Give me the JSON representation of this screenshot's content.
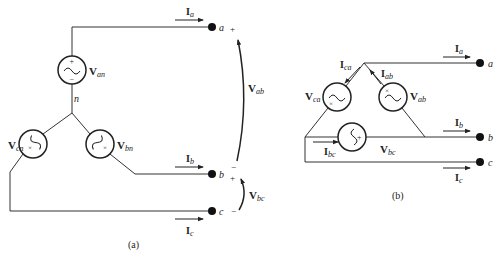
{
  "figure_a": {
    "caption": "(a)",
    "node_n": "n",
    "terminals": {
      "a": "a",
      "b": "b",
      "c": "c"
    },
    "sources": {
      "an": {
        "V": "V",
        "sub": "an"
      },
      "bn": {
        "V": "V",
        "sub": "bn"
      },
      "cn": {
        "V": "V",
        "sub": "cn"
      }
    },
    "currents": {
      "a": {
        "I": "I",
        "sub": "a"
      },
      "b": {
        "I": "I",
        "sub": "b"
      },
      "c": {
        "I": "I",
        "sub": "c"
      }
    },
    "line_voltages": {
      "ab": {
        "V": "V",
        "sub": "ab"
      },
      "bc": {
        "V": "V",
        "sub": "bc"
      }
    },
    "polarity": {
      "plus": "+",
      "minus": "−"
    }
  },
  "figure_b": {
    "caption": "(b)",
    "terminals": {
      "a": "a",
      "b": "b",
      "c": "c"
    },
    "sources": {
      "ab": {
        "V": "V",
        "sub": "ab"
      },
      "bc": {
        "V": "V",
        "sub": "bc"
      },
      "ca": {
        "V": "V",
        "sub": "ca"
      }
    },
    "line_currents": {
      "a": {
        "I": "I",
        "sub": "a"
      },
      "b": {
        "I": "I",
        "sub": "b"
      },
      "c": {
        "I": "I",
        "sub": "c"
      }
    },
    "phase_currents": {
      "ab": {
        "I": "I",
        "sub": "ab"
      },
      "bc": {
        "I": "I",
        "sub": "bc"
      },
      "ca": {
        "I": "I",
        "sub": "ca"
      }
    },
    "polarity": {
      "plus": "+",
      "minus": "−",
      "cross": "×"
    }
  }
}
